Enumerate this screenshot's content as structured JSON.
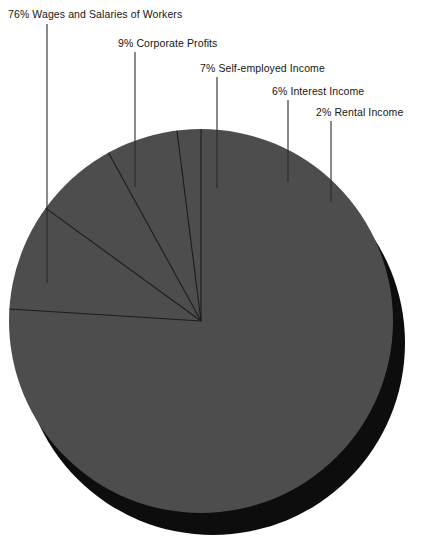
{
  "chart_data": {
    "type": "pie",
    "title": "",
    "subtitle": "",
    "xlabel": "",
    "ylabel": "",
    "legend_position": "callout-labels-top",
    "grid": false,
    "units": "percent",
    "total": 100,
    "categories": [
      "Wages and Salaries of Workers",
      "Corporate Profits",
      "Self-employed Income",
      "Interest Income",
      "Rental Income"
    ],
    "values": [
      76,
      9,
      7,
      6,
      2
    ],
    "labels": [
      "76% Wages and Salaries of Workers",
      "9% Corporate Profits",
      "7% Self-employed Income",
      "6% Interest Income",
      "2% Rental Income"
    ],
    "slices": [
      {
        "label": "76% Wages and Salaries of Workers",
        "name": "Wages and Salaries of Workers",
        "value": 76,
        "percent_text": "76%",
        "start_angle": 0,
        "end_angle": 273.6,
        "color": "#4d4d4d"
      },
      {
        "label": "9% Corporate Profits",
        "name": "Corporate Profits",
        "value": 9,
        "percent_text": "9%",
        "start_angle": 273.6,
        "end_angle": 306.0,
        "color": "#4d4d4d"
      },
      {
        "label": "7% Self-employed Income",
        "name": "Self-employed Income",
        "value": 7,
        "percent_text": "7%",
        "start_angle": 306.0,
        "end_angle": 331.2,
        "color": "#4d4d4d"
      },
      {
        "label": "6% Interest Income",
        "name": "Interest Income",
        "value": 6,
        "percent_text": "6%",
        "start_angle": 331.2,
        "end_angle": 352.8,
        "color": "#4d4d4d"
      },
      {
        "label": "2% Rental Income",
        "name": "Rental Income",
        "value": 2,
        "percent_text": "2%",
        "start_angle": 352.8,
        "end_angle": 360.0,
        "color": "#4d4d4d"
      }
    ]
  },
  "colors": {
    "slice_fill": "#4d4d4d",
    "shadow": "#0d0d0d",
    "divider": "#1c1c1c",
    "leader_line": "#2b2b2b",
    "text": "#161616",
    "background": "#ffffff"
  },
  "callouts": [
    {
      "id": "wages",
      "text": "76% Wages and Salaries of Workers",
      "label_x": 8,
      "label_y": 8,
      "line_x": 47,
      "line_y1": 24,
      "line_y2": 283
    },
    {
      "id": "corporate",
      "text": "9% Corporate Profits",
      "label_x": 118,
      "label_y": 37,
      "line_x": 135,
      "line_y1": 52,
      "line_y2": 187
    },
    {
      "id": "selfemployed",
      "text": "7% Self-employed Income",
      "label_x": 200,
      "label_y": 62,
      "line_x": 217,
      "line_y1": 77,
      "line_y2": 188
    },
    {
      "id": "interest",
      "text": "6% Interest Income",
      "label_x": 272,
      "label_y": 85,
      "line_x": 288,
      "line_y1": 100,
      "line_y2": 182
    },
    {
      "id": "rental",
      "text": "2% Rental Income",
      "label_x": 316,
      "label_y": 106,
      "line_x": 331,
      "line_y1": 121,
      "line_y2": 202
    }
  ],
  "geometry": {
    "center_x": 201,
    "center_y": 321,
    "radius": 192,
    "shadow_offset_x": 12,
    "shadow_offset_y": 22
  }
}
